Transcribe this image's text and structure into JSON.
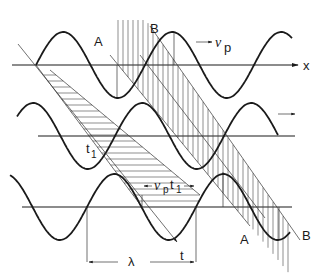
{
  "figure": {
    "labels": {
      "x_axis": "x",
      "velocity": "v",
      "velocity_sub": "p",
      "time1": "t",
      "time1_sub": "1",
      "time_axis": "t",
      "wavelength": "λ",
      "distance": "v",
      "distance_sub": "p",
      "distance_t": "t",
      "distance_t_sub": "1",
      "phase_a_top": "A",
      "phase_b_top": "B",
      "phase_a_bottom": "A",
      "phase_b_bottom": "B"
    },
    "colors": {
      "ink": "#1a1a1a",
      "paper": "#ffffff"
    }
  }
}
